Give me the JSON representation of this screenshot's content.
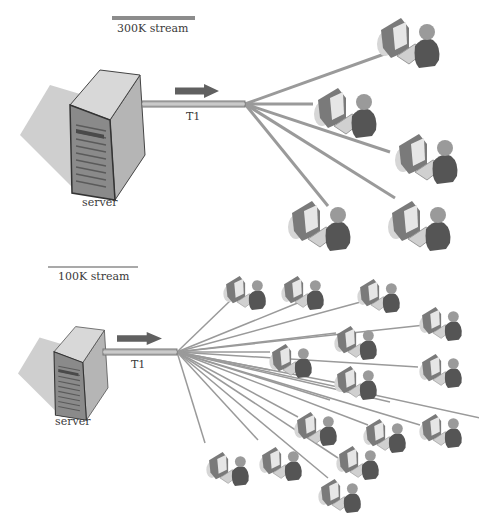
{
  "diagram": {
    "colors": {
      "line": "#9a9a9a",
      "pipe": "#b8b8b8",
      "pipe_edge": "#777777",
      "arrow": "#606060",
      "server_front": "#8a8a8a",
      "server_side": "#b5b5b5",
      "server_top": "#d8d8d8",
      "shadow": "#cfcfcf",
      "person": "#555555",
      "head": "#9a9a9a",
      "monitor": "#7a7a7a",
      "screen": "#e6e6e6",
      "keyboard": "#d0d0d0"
    },
    "sections": [
      {
        "id": "top",
        "stream_label": "300K stream",
        "stream_bar": {
          "x1": 112,
          "x2": 195,
          "y": 18,
          "width": 4
        },
        "link_label": "T1",
        "server_label": "server",
        "server": {
          "x": 20,
          "y": 65,
          "scale": 1.0
        },
        "pipe": {
          "x1": 142,
          "x2": 245,
          "y": 104
        },
        "arrow": {
          "x": 175,
          "y": 84,
          "w": 44,
          "h": 14
        },
        "hub": {
          "x": 245,
          "y": 104
        },
        "line_width": 3,
        "clients": [
          {
            "x": 375,
            "y": 12,
            "s": 1.0,
            "end": [
              390,
              52
            ]
          },
          {
            "x": 312,
            "y": 82,
            "s": 1.0,
            "end": [
              313,
              104
            ]
          },
          {
            "x": 393,
            "y": 128,
            "s": 1.0,
            "end": [
              390,
              152
            ]
          },
          {
            "x": 286,
            "y": 195,
            "s": 1.0,
            "end": [
              328,
              206
            ]
          },
          {
            "x": 386,
            "y": 195,
            "s": 1.0,
            "end": [
              395,
              198
            ]
          }
        ]
      },
      {
        "id": "bottom",
        "stream_label": "100K stream",
        "stream_bar": {
          "x1": 48,
          "x2": 138,
          "y": 267,
          "width": 1.5
        },
        "link_label": "T1",
        "server_label": "server",
        "server": {
          "x": 18,
          "y": 323,
          "scale": 0.72
        },
        "pipe": {
          "x1": 103,
          "x2": 177,
          "y": 352
        },
        "arrow": {
          "x": 117,
          "y": 332,
          "w": 45,
          "h": 13
        },
        "hub": {
          "x": 177,
          "y": 352
        },
        "line_width": 1.5,
        "clients": [
          {
            "x": 222,
            "y": 272,
            "s": 0.68,
            "end": [
              232,
              299
            ]
          },
          {
            "x": 280,
            "y": 272,
            "s": 0.68,
            "end": [
              300,
              302
            ]
          },
          {
            "x": 356,
            "y": 275,
            "s": 0.68,
            "end": [
              368,
              300
            ]
          },
          {
            "x": 418,
            "y": 303,
            "s": 0.68,
            "end": [
              425,
              325
            ]
          },
          {
            "x": 333,
            "y": 322,
            "s": 0.68,
            "end": [
              336,
              333
            ]
          },
          {
            "x": 268,
            "y": 340,
            "s": 0.68,
            "end": [
              270,
              352
            ]
          },
          {
            "x": 418,
            "y": 350,
            "s": 0.68,
            "end": [
              418,
              367
            ]
          },
          {
            "x": 333,
            "y": 362,
            "s": 0.68,
            "end": [
              338,
              383
            ]
          },
          {
            "x": 293,
            "y": 408,
            "s": 0.68,
            "end": [
              298,
              417
            ]
          },
          {
            "x": 362,
            "y": 415,
            "s": 0.68,
            "end": [
              368,
              425
            ]
          },
          {
            "x": 418,
            "y": 410,
            "s": 0.68,
            "end": [
              420,
              425
            ]
          },
          {
            "x": 335,
            "y": 442,
            "s": 0.68,
            "end": [
              338,
              458
            ]
          },
          {
            "x": 205,
            "y": 448,
            "s": 0.68,
            "end": [
              205,
              443
            ]
          },
          {
            "x": 258,
            "y": 443,
            "s": 0.68,
            "end": [
              258,
              440
            ]
          },
          {
            "x": 317,
            "y": 475,
            "s": 0.68,
            "end": [
              328,
              478
            ]
          }
        ],
        "extra_lines": [
          [
            177,
            352,
            270,
            370
          ],
          [
            177,
            352,
            330,
            400
          ],
          [
            177,
            352,
            390,
            402
          ],
          [
            177,
            352,
            480,
            418
          ]
        ]
      }
    ],
    "text": {
      "top_stream": "300K stream",
      "bottom_stream": "100K stream",
      "top_link": "T1",
      "bottom_link": "T1",
      "top_server": "server",
      "bottom_server": "server"
    }
  }
}
